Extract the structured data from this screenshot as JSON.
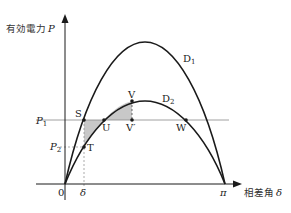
{
  "diagram": {
    "axes": {
      "y_label": "有効電力",
      "y_symbol": "P",
      "x_label": "相差角",
      "x_symbol": "δ",
      "origin_label": "0",
      "pi_label": "π"
    },
    "curves": [
      {
        "name": "D1",
        "label": "D",
        "sub": "1"
      },
      {
        "name": "D2",
        "label": "D",
        "sub": "2"
      }
    ],
    "levels": {
      "p1": {
        "label": "P",
        "sub": "1"
      },
      "p2": {
        "label": "P",
        "sub": "2"
      },
      "delta": "δ"
    },
    "points": {
      "S": "S",
      "T": "T",
      "U": "U",
      "V": "V",
      "V_prime": "V′",
      "W": "W"
    },
    "colors": {
      "line": "#1a1a1a",
      "shade": "#c8c8c8",
      "guide": "#888888"
    }
  }
}
